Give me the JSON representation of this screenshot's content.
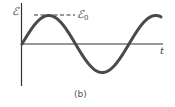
{
  "figure": {
    "caption": "(b)",
    "y_axis_symbol": "ℰ",
    "amplitude_symbol": "ℰ",
    "amplitude_subscript": "0",
    "x_axis_symbol": "t"
  },
  "colors": {
    "curve": "#4a4a4a",
    "axes": "#333333",
    "dashed": "#333333",
    "text": "#444444",
    "background": "#ffffff"
  },
  "chart_data": {
    "type": "line",
    "title": "",
    "xlabel": "t",
    "ylabel": "ℰ",
    "caption": "(b)",
    "function": "ℰ = ℰ0 sin(ωt)",
    "amplitude_label": "ℰ0",
    "series": [
      {
        "name": "ℰ(t)",
        "x_phase_cycles": [
          0,
          0.25,
          0.5,
          0.75,
          1.0,
          1.3
        ],
        "values_normalized": [
          0,
          1,
          0,
          -1,
          0,
          0.81
        ]
      }
    ],
    "ylim": [
      -1,
      1
    ],
    "grid": false,
    "legend": "none",
    "annotations": [
      {
        "type": "dashed_hline",
        "y": 1,
        "label": "ℰ0"
      }
    ]
  }
}
